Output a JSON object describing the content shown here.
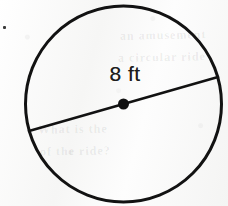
{
  "figure": {
    "kind": "circle-diagram",
    "background_color": "#fbfbfb",
    "ink_color": "#111111",
    "label": "8 ft",
    "label_meaning": "diameter",
    "circle": {
      "center_x": 123.5,
      "center_y": 104,
      "radius": 98,
      "stroke_width": 3,
      "fill": "none"
    },
    "diameter_segment": {
      "x1": 29,
      "y1": 131,
      "x2": 218,
      "y2": 77,
      "stroke_width": 2.6
    },
    "center_dot": {
      "cx": 123.5,
      "cy": 104,
      "r": 5.5
    },
    "stray_mark": {
      "x": 3,
      "y": 26,
      "size": 3
    },
    "show_through_text": [
      {
        "text": "an amusement",
        "x": 120,
        "y": 34,
        "size": 12,
        "rotate": -1
      },
      {
        "text": "a circular ride",
        "x": 118,
        "y": 56,
        "size": 12,
        "rotate": -1
      },
      {
        "text": "What is the",
        "x": 38,
        "y": 128,
        "size": 12,
        "rotate": -1
      },
      {
        "text": "of the ride?",
        "x": 40,
        "y": 150,
        "size": 12,
        "rotate": -1
      }
    ]
  }
}
